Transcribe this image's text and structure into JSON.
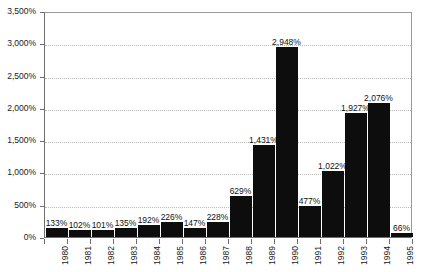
{
  "chart_data": {
    "type": "bar",
    "title": "",
    "subtitle": "",
    "xlabel": "",
    "ylabel": "",
    "categories": [
      "1980",
      "1981",
      "1982",
      "1983",
      "1984",
      "1985",
      "1986",
      "1987",
      "1988",
      "1989",
      "1990",
      "1991",
      "1992",
      "1993",
      "1994",
      "1995"
    ],
    "values": [
      133,
      102,
      101,
      135,
      192,
      226,
      147,
      228,
      629,
      1431,
      2948,
      477,
      1022,
      1927,
      2076,
      66
    ],
    "value_labels": [
      "133%",
      "102%",
      "101%",
      "135%",
      "192%",
      "226%",
      "147%",
      "228%",
      "629%",
      "1,431%",
      "2,948%",
      "477%",
      "1,022%",
      "1,927%",
      "2,076%",
      "66%"
    ],
    "ylim": [
      0,
      3500
    ],
    "ytick_step": 500,
    "ytick_labels": [
      "0%",
      "500%",
      "1,000%",
      "1,500%",
      "2,000%",
      "2,500%",
      "3,000%",
      "3,500%"
    ],
    "ytick_values": [
      0,
      500,
      1000,
      1500,
      2000,
      2500,
      3000,
      3500
    ],
    "grid": true,
    "grid_axis": "y",
    "grid_style": "dotted",
    "legend": false,
    "legend_position": "none",
    "series": [
      {
        "name": "",
        "values": [
          133,
          102,
          101,
          135,
          192,
          226,
          147,
          228,
          629,
          1431,
          2948,
          477,
          1022,
          1927,
          2076,
          66
        ]
      }
    ],
    "colors": {
      "bar": "#0d0d0d",
      "grid": "#bcbcbc",
      "axis": "#6e6e6e",
      "border": "#9a9a9a",
      "text": "#1a1a1a",
      "background": "#ffffff"
    }
  }
}
